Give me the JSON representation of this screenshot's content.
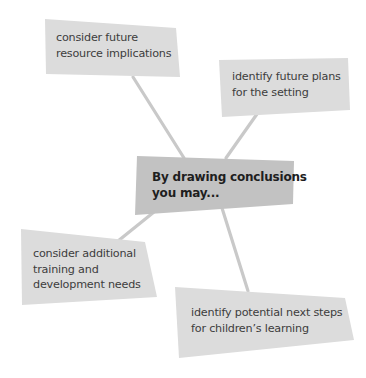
{
  "diagram": {
    "type": "spider-diagram",
    "colors": {
      "background": "#ffffff",
      "leaf_box": "#dcdcdc",
      "center_box": "#c2c2c2",
      "connector": "#c9c9c9",
      "leaf_text": "#3d3d3d",
      "center_text": "#1e1e1e"
    },
    "center": {
      "lines": [
        "By drawing conclusions",
        "you may..."
      ]
    },
    "nodes": [
      {
        "id": "top-left",
        "lines": [
          "consider future",
          "resource implications"
        ]
      },
      {
        "id": "top-right",
        "lines": [
          "identify future plans",
          "for the setting"
        ]
      },
      {
        "id": "bottom-left",
        "lines": [
          "consider additional",
          "training and",
          "development needs"
        ]
      },
      {
        "id": "bottom-right",
        "lines": [
          "identify potential next steps",
          "for children’s learning"
        ]
      }
    ]
  }
}
